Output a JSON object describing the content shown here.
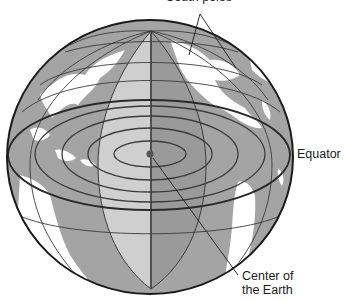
{
  "diagram": {
    "type": "globe-cross-section",
    "labels": {
      "top_pointer": "South poles",
      "equator": "Equator",
      "center_line1": "Center of",
      "center_line2": "the Earth"
    },
    "colors": {
      "ocean": "#a4a4a4",
      "land": "#ffffff",
      "wedge_light": "#cfcfcf",
      "wedge_dark": "#9a9a9a",
      "outline": "#1a1a1a",
      "grid": "#3c3c3c",
      "center_dot": "#555555"
    },
    "elements": [
      "globe-outline",
      "equator-ellipse",
      "concentric-ellipses",
      "meridian-lines",
      "wedge-cutaway",
      "center-dot",
      "leader-lines"
    ]
  }
}
